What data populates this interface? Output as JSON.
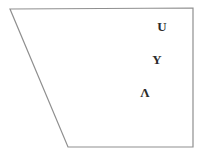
{
  "figure": {
    "background": "#ffffff",
    "outline_color": "#8f8f8f",
    "text_color": "#2b2b2b",
    "shape": {
      "type": "trapezoid",
      "points": "10,9 193,8 193,147 68,147"
    },
    "labels": [
      {
        "text": "U",
        "x": 162,
        "y": 26
      },
      {
        "text": "Y",
        "x": 157,
        "y": 59
      },
      {
        "text": "Λ",
        "x": 145,
        "y": 92
      }
    ]
  }
}
